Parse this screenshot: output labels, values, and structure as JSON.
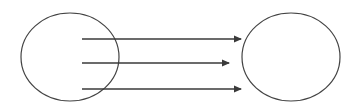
{
  "diagram": {
    "type": "mapping",
    "colors": {
      "stroke": "#444444",
      "arrow": "#3a3a3a",
      "background": "#ffffff"
    },
    "nodes": [
      {
        "id": "left-set",
        "shape": "ellipse",
        "cx": 70,
        "cy": 57,
        "rx": 49,
        "ry": 44
      },
      {
        "id": "right-set",
        "shape": "ellipse",
        "cx": 291,
        "cy": 57,
        "rx": 49,
        "ry": 44
      }
    ],
    "edges": [
      {
        "from": "left-set",
        "to": "right-set",
        "x1": 82,
        "y1": 39,
        "x2": 241,
        "y2": 39
      },
      {
        "from": "left-set",
        "to": "right-set",
        "x1": 82,
        "y1": 63,
        "x2": 229,
        "y2": 63
      },
      {
        "from": "left-set",
        "to": "right-set",
        "x1": 82,
        "y1": 89,
        "x2": 241,
        "y2": 89
      }
    ]
  }
}
